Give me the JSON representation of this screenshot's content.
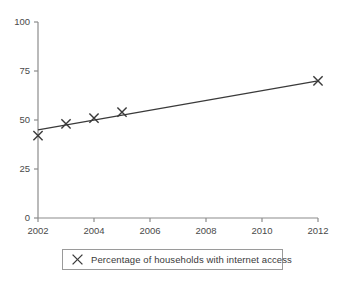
{
  "chart_data": {
    "type": "scatter",
    "title": "",
    "subtitle": "",
    "xlabel": "",
    "ylabel": "",
    "xlim": [
      2002,
      2012
    ],
    "ylim": [
      0,
      100
    ],
    "grid": false,
    "legend_position": "bottom",
    "x_ticks": [
      "2002",
      "2004",
      "2006",
      "2008",
      "2010",
      "2012"
    ],
    "y_ticks": [
      "0",
      "25",
      "50",
      "75",
      "100"
    ],
    "x": [
      2002,
      2003,
      2004,
      2005,
      2012
    ],
    "values": [
      42,
      48,
      51,
      54,
      70
    ],
    "marker": "x",
    "series": [
      {
        "name": "Percentage of households with internet access",
        "x": [
          2002,
          2003,
          2004,
          2005,
          2012
        ],
        "values": [
          42,
          48,
          51,
          54,
          70
        ]
      }
    ],
    "trend_line": {
      "name": "line of best fit",
      "x_start": 2002,
      "y_start": 45,
      "x_end": 2012,
      "y_end": 70
    },
    "annotations": []
  },
  "legend": {
    "marker_icon": "x-marker-icon",
    "entries": [
      {
        "label": "Percentage of households with internet access"
      }
    ]
  },
  "colors": {
    "axis": "#8c8c8c",
    "marker": "#3a3a3a",
    "line": "#3a3a3a",
    "text": "#3a3a3a",
    "background": "#ffffff",
    "legend_border": "#9a9a9a"
  }
}
